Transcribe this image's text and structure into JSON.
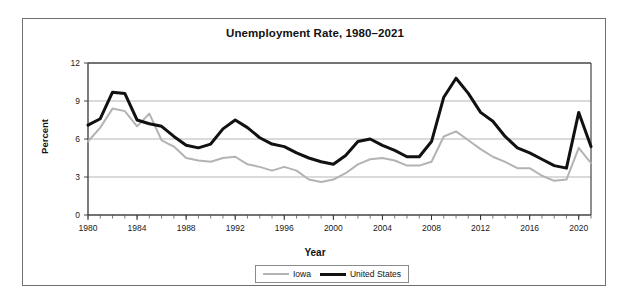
{
  "header_note": "",
  "chart_data": {
    "type": "line",
    "title": "Unemployment Rate, 1980–2021",
    "xlabel": "Year",
    "ylabel": "Percent",
    "xlim": [
      1980,
      2021
    ],
    "ylim": [
      0,
      12
    ],
    "y_ticks": [
      0,
      3,
      6,
      9,
      12
    ],
    "x_ticks": [
      1980,
      1984,
      1988,
      1992,
      1996,
      2000,
      2004,
      2008,
      2012,
      2016,
      2020
    ],
    "x_minor_tick_interval": 1,
    "grid": "horizontal",
    "legend_position": "bottom-center",
    "x": [
      1980,
      1981,
      1982,
      1983,
      1984,
      1985,
      1986,
      1987,
      1988,
      1989,
      1990,
      1991,
      1992,
      1993,
      1994,
      1995,
      1996,
      1997,
      1998,
      1999,
      2000,
      2001,
      2002,
      2003,
      2004,
      2005,
      2006,
      2007,
      2008,
      2009,
      2010,
      2011,
      2012,
      2013,
      2014,
      2015,
      2016,
      2017,
      2018,
      2019,
      2020,
      2021
    ],
    "series": [
      {
        "name": "Iowa",
        "color": "#b3b3b3",
        "line_width": 2,
        "values": [
          5.8,
          6.9,
          8.4,
          8.2,
          7.0,
          8.0,
          5.9,
          5.4,
          4.5,
          4.3,
          4.2,
          4.5,
          4.6,
          4.0,
          3.8,
          3.5,
          3.8,
          3.5,
          2.8,
          2.6,
          2.8,
          3.3,
          4.0,
          4.4,
          4.5,
          4.3,
          3.9,
          3.9,
          4.2,
          6.2,
          6.6,
          5.9,
          5.2,
          4.6,
          4.2,
          3.7,
          3.7,
          3.1,
          2.7,
          2.8,
          5.3,
          4.1
        ]
      },
      {
        "name": "United States",
        "color": "#111111",
        "line_width": 3,
        "values": [
          7.1,
          7.6,
          9.7,
          9.6,
          7.5,
          7.2,
          7.0,
          6.2,
          5.5,
          5.3,
          5.6,
          6.8,
          7.5,
          6.9,
          6.1,
          5.6,
          5.4,
          4.9,
          4.5,
          4.2,
          4.0,
          4.7,
          5.8,
          6.0,
          5.5,
          5.1,
          4.6,
          4.6,
          5.8,
          9.3,
          10.8,
          9.6,
          8.1,
          7.4,
          6.2,
          5.3,
          4.9,
          4.4,
          3.9,
          3.7,
          8.1,
          5.4
        ]
      }
    ]
  },
  "legend": {
    "items": [
      {
        "label": "Iowa"
      },
      {
        "label": "United States"
      }
    ]
  }
}
